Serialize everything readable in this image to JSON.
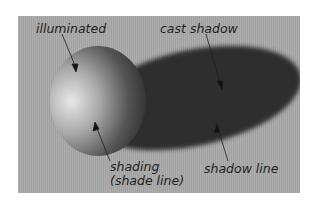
{
  "figure": {
    "labels": {
      "illuminated": "illuminated",
      "cast_shadow": "cast shadow",
      "shading_line1": "shading",
      "shading_line2": "(shade line)",
      "shadow_line": "shadow line"
    },
    "colors": {
      "background": "#a9a9a9",
      "shadow": "#2e2e2e",
      "text": "#1e1e1e"
    }
  }
}
